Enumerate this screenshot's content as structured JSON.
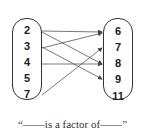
{
  "relation": {
    "domain_set": [
      "2",
      "3",
      "4",
      "5",
      "7"
    ],
    "codomain_set": [
      "6",
      "7",
      "8",
      "9",
      "11"
    ],
    "mappings": [
      {
        "from": "2",
        "to": "6"
      },
      {
        "from": "2",
        "to": "8"
      },
      {
        "from": "3",
        "to": "6"
      },
      {
        "from": "3",
        "to": "9"
      },
      {
        "from": "4",
        "to": "8"
      },
      {
        "from": "7",
        "to": "7"
      }
    ],
    "caption": "“——is a factor of——”"
  }
}
